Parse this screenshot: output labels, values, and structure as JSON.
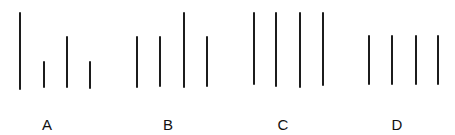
{
  "figure": {
    "stroke_color": "#1c1c1c",
    "groups": [
      {
        "label": "A",
        "label_pos": [
          47,
          124
        ],
        "lines": [
          {
            "x": 20,
            "top": 12,
            "bottom": 90
          },
          {
            "x": 44,
            "top": 61,
            "bottom": 88
          },
          {
            "x": 67,
            "top": 36,
            "bottom": 88
          },
          {
            "x": 90,
            "top": 61,
            "bottom": 89
          }
        ]
      },
      {
        "label": "B",
        "label_pos": [
          168,
          124
        ],
        "lines": [
          {
            "x": 137,
            "top": 36,
            "bottom": 88
          },
          {
            "x": 160,
            "top": 36,
            "bottom": 87
          },
          {
            "x": 184,
            "top": 12,
            "bottom": 88
          },
          {
            "x": 207,
            "top": 36,
            "bottom": 87
          }
        ]
      },
      {
        "label": "C",
        "label_pos": [
          283,
          124
        ],
        "lines": [
          {
            "x": 254,
            "top": 12,
            "bottom": 85
          },
          {
            "x": 276,
            "top": 12,
            "bottom": 87
          },
          {
            "x": 300,
            "top": 12,
            "bottom": 88
          },
          {
            "x": 323,
            "top": 12,
            "bottom": 86
          }
        ]
      },
      {
        "label": "D",
        "label_pos": [
          397,
          124
        ],
        "lines": [
          {
            "x": 369,
            "top": 35,
            "bottom": 85
          },
          {
            "x": 392,
            "top": 35,
            "bottom": 85
          },
          {
            "x": 416,
            "top": 35,
            "bottom": 85
          },
          {
            "x": 438,
            "top": 35,
            "bottom": 85
          }
        ]
      }
    ]
  }
}
